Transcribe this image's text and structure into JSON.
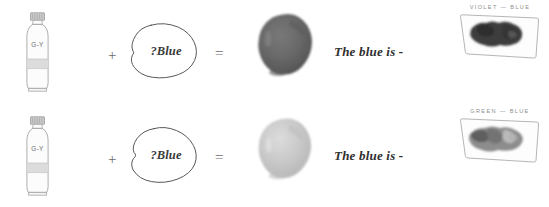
{
  "page": {
    "background": "#ffffff",
    "width": 549,
    "height": 207
  },
  "symbols": {
    "plus": "+",
    "equals": "="
  },
  "colors": {
    "tube_outline": "#9a9a9a",
    "tube_cap": "#b8b8b8",
    "tube_band": "#d6d6d6",
    "blob_outline": "#4a4a4a",
    "label_text": "#8e8e8e",
    "caption_text": "#2f2f2f",
    "splotch_row1": "#636363",
    "splotch_row2": "#c6c6c6",
    "swatch_stroke_row1": "#3a3a3a",
    "swatch_stroke_row2": "#7a7a7a",
    "card_outline": "#a8a8a8"
  },
  "rows": [
    {
      "id": "row-violet-blue",
      "tube": {
        "label": "G-Y",
        "icon": "paint-tube-icon"
      },
      "operator_add": "+",
      "unknown": {
        "label": "?Blue",
        "icon": "hand-drawn-blob-icon"
      },
      "operator_equals": "=",
      "result": {
        "icon": "paint-splotch-icon",
        "tone": "dark"
      },
      "caption": "The blue is -",
      "swatch": {
        "title": "VIOLET — BLUE",
        "icon": "colour-swatch-card-icon",
        "tone": "dark"
      }
    },
    {
      "id": "row-green-blue",
      "tube": {
        "label": "G-Y",
        "icon": "paint-tube-icon"
      },
      "operator_add": "+",
      "unknown": {
        "label": "?Blue",
        "icon": "hand-drawn-blob-icon"
      },
      "operator_equals": "=",
      "result": {
        "icon": "paint-splotch-icon",
        "tone": "light"
      },
      "caption": "The blue is -",
      "swatch": {
        "title": "GREEN — BLUE",
        "icon": "colour-swatch-card-icon",
        "tone": "light"
      }
    }
  ]
}
